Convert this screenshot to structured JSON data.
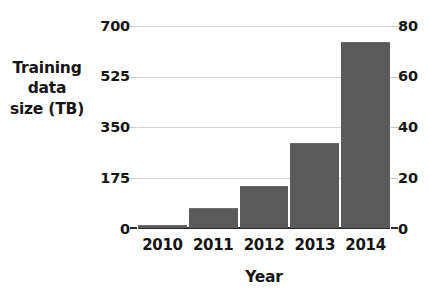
{
  "chart_data": {
    "type": "bar",
    "title": "",
    "categories": [
      "2010",
      "2011",
      "2012",
      "2013",
      "2014"
    ],
    "values": [
      10,
      70,
      145,
      295,
      645
    ],
    "series": [
      {
        "name": "Training data size (TB)",
        "values": [
          10,
          70,
          145,
          295,
          645
        ]
      }
    ],
    "xlabel": "Year",
    "ylabel": "Training data size (TB)",
    "ylabel_lines": [
      "Training",
      "data",
      "size (TB)"
    ],
    "ylim": [
      0,
      700
    ],
    "yticks": [
      0,
      175,
      350,
      525,
      700
    ],
    "ytick_labels": [
      "0",
      "175",
      "350",
      "525",
      "700"
    ],
    "y2label": "",
    "y2lim": [
      0,
      80
    ],
    "y2ticks": [
      0,
      20,
      40,
      60,
      80
    ],
    "y2tick_labels": [
      "0",
      "20",
      "40",
      "60",
      "80"
    ],
    "y2_values": [
      1.1,
      8,
      16.5,
      34,
      74
    ],
    "grid": true,
    "legend": false,
    "legend_position": "none",
    "bar_color": "#5a5a5a",
    "gridline_color": "#d2d2d2",
    "axis_color": "#2b2b2b",
    "background_color": "#ffffff"
  }
}
